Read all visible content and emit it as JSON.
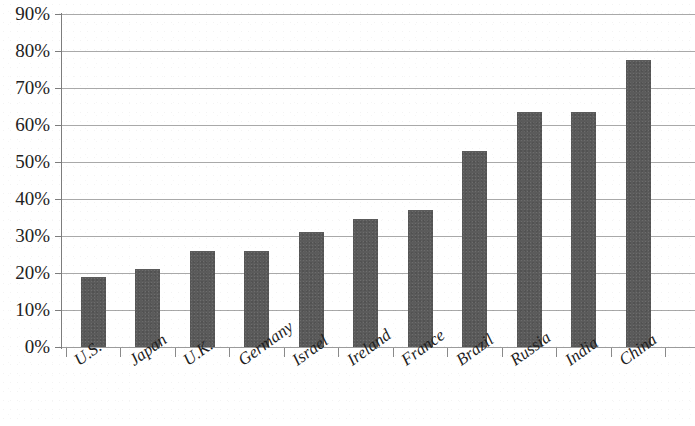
{
  "chart_data": {
    "type": "bar",
    "title": "",
    "subtitle": "",
    "xlabel": "",
    "ylabel": "",
    "categories": [
      "U.S.",
      "Japan",
      "U.K.",
      "Germany",
      "Israel",
      "Ireland",
      "France",
      "Brazil",
      "Russia",
      "India",
      "China"
    ],
    "values": [
      19,
      21,
      26,
      26,
      31,
      34.5,
      37,
      53,
      63.5,
      63.5,
      77.5
    ],
    "series": [
      {
        "name": "",
        "values": [
          19,
          21,
          26,
          26,
          31,
          34.5,
          37,
          53,
          63.5,
          63.5,
          77.5
        ]
      }
    ],
    "ylim": [
      0,
      90
    ],
    "y_tick_step": 10,
    "y_tick_labels": [
      "0%",
      "10%",
      "20%",
      "30%",
      "40%",
      "50%",
      "60%",
      "70%",
      "80%",
      "90%"
    ],
    "y_tick_values": [
      0,
      10,
      20,
      30,
      40,
      50,
      60,
      70,
      80,
      90
    ],
    "value_format": "percent",
    "grid": "horizontal",
    "legend": "none",
    "bar_color": "#5b5b5b",
    "gridline_color": "#9a9a9a",
    "axis_color": "#7d7d7d",
    "background_color": "#ffffff",
    "x_label_rotation_deg": -36
  }
}
